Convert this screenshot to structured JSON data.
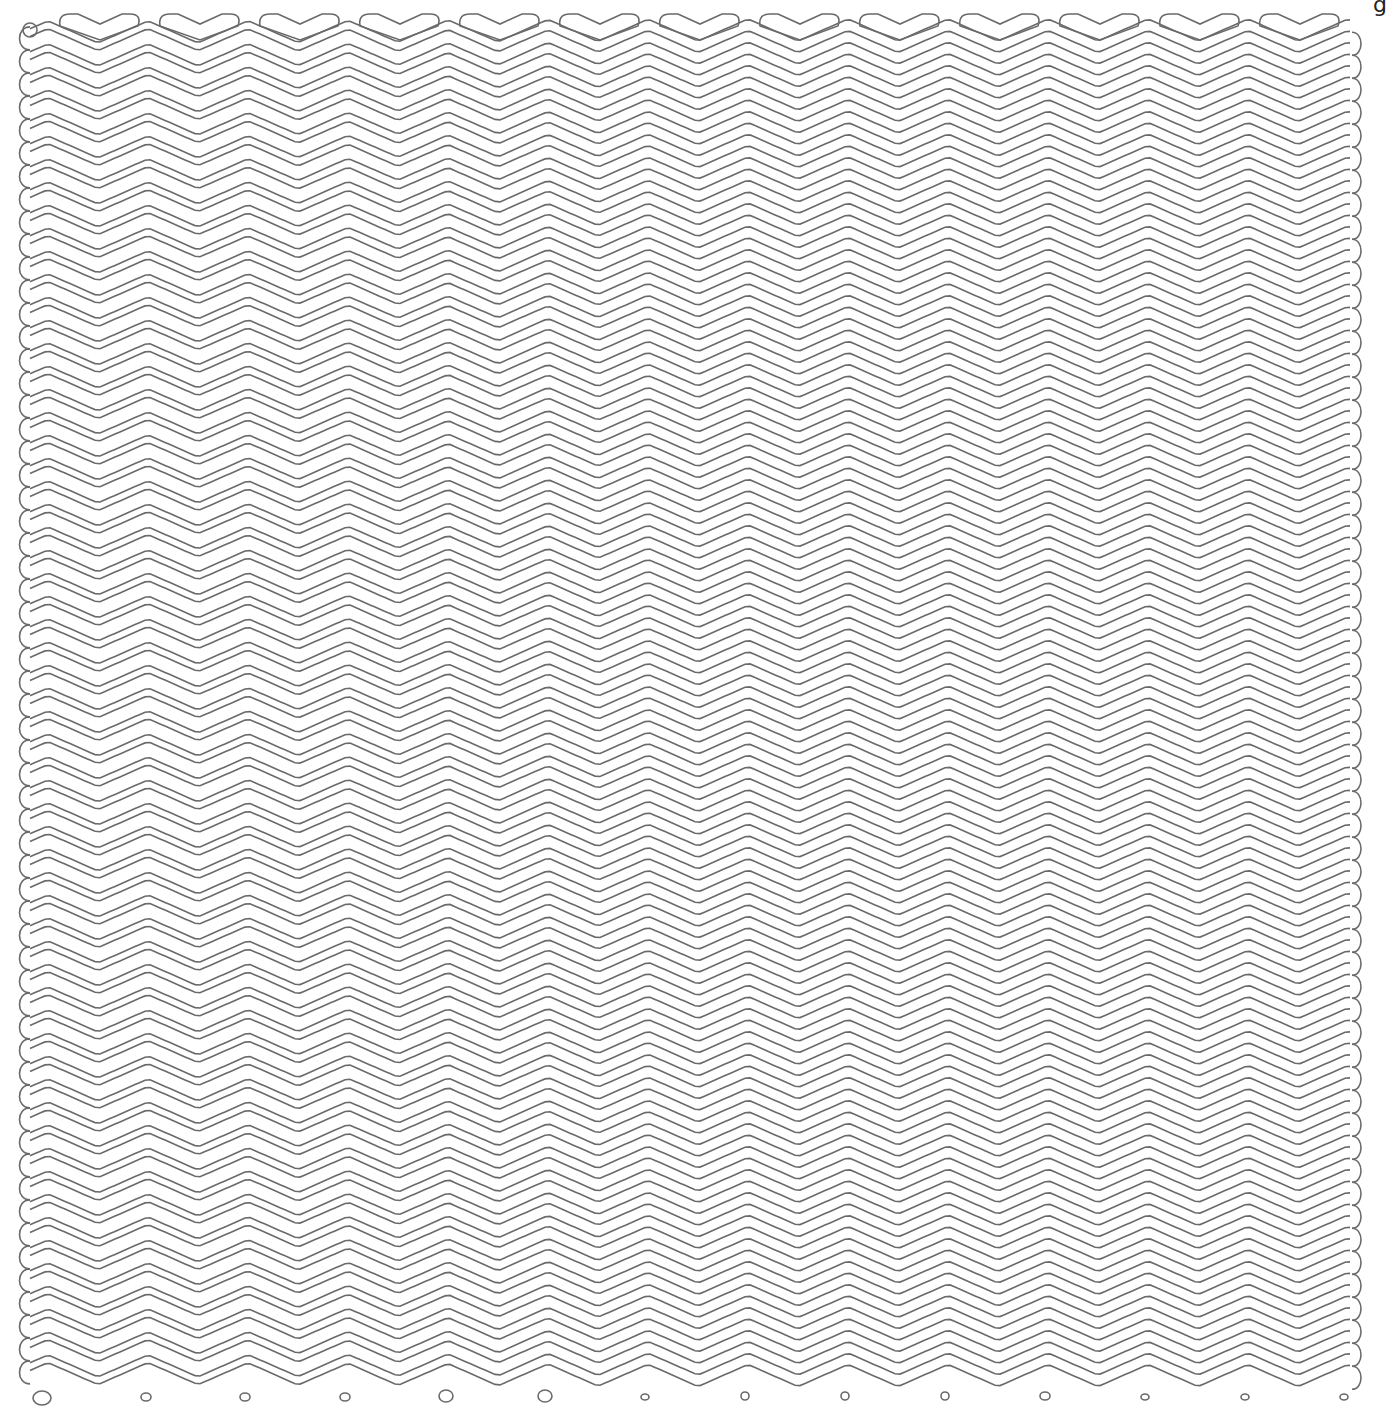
{
  "artwork": {
    "title": "Continuous zigzag line drawing",
    "canvas": {
      "width": 1391,
      "height": 1411,
      "background": "#ffffff"
    },
    "stroke": {
      "color": "#6a6a6a",
      "width": 1.6
    },
    "zigzag": {
      "period_px": 100,
      "amplitude_px": 11,
      "first_peak_x": 48,
      "x_start": 30,
      "x_end": 1352,
      "row_count": 120,
      "row_pitch_px": 11.5,
      "first_row_y": 30,
      "pair_gap_left_px": 4
    },
    "top_chevrons": {
      "centers_x": [
        100,
        200,
        300,
        400,
        500,
        600,
        700,
        800,
        900,
        1000,
        1100,
        1200,
        1300
      ],
      "y": 22
    },
    "top_left_circle": {
      "cx": 30,
      "cy": 30,
      "r": 7
    },
    "bottom_circles": [
      {
        "cx": 42,
        "cy": 1398,
        "rx": 9,
        "ry": 7
      },
      {
        "cx": 146,
        "cy": 1397,
        "rx": 5,
        "ry": 4
      },
      {
        "cx": 245,
        "cy": 1397,
        "rx": 5,
        "ry": 4
      },
      {
        "cx": 345,
        "cy": 1397,
        "rx": 5,
        "ry": 4
      },
      {
        "cx": 446,
        "cy": 1396,
        "rx": 7,
        "ry": 6
      },
      {
        "cx": 545,
        "cy": 1396,
        "rx": 7,
        "ry": 6
      },
      {
        "cx": 645,
        "cy": 1397,
        "rx": 4,
        "ry": 3
      },
      {
        "cx": 745,
        "cy": 1396,
        "rx": 4,
        "ry": 4
      },
      {
        "cx": 845,
        "cy": 1396,
        "rx": 4,
        "ry": 4
      },
      {
        "cx": 945,
        "cy": 1396,
        "rx": 4,
        "ry": 4
      },
      {
        "cx": 1045,
        "cy": 1396,
        "rx": 5,
        "ry": 4
      },
      {
        "cx": 1145,
        "cy": 1397,
        "rx": 4,
        "ry": 3
      },
      {
        "cx": 1245,
        "cy": 1397,
        "rx": 4,
        "ry": 3
      },
      {
        "cx": 1344,
        "cy": 1397,
        "rx": 4,
        "ry": 3
      }
    ],
    "corner_glyph": "g"
  }
}
